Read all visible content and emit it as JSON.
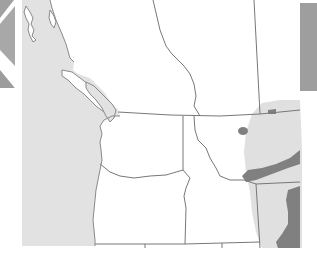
{
  "map": {
    "region": "Pacific Northwest",
    "colors": {
      "background": "#ffffff",
      "ocean": "#e2e2e2",
      "light_range": "#e0e0e0",
      "dark_range": "#808080",
      "border": "#777777",
      "coast": "#8a8a8a",
      "edge_panel": "#9c9c9c"
    },
    "layers": [
      "ocean",
      "land",
      "state-borders",
      "light-range",
      "dark-range"
    ],
    "labels": []
  }
}
